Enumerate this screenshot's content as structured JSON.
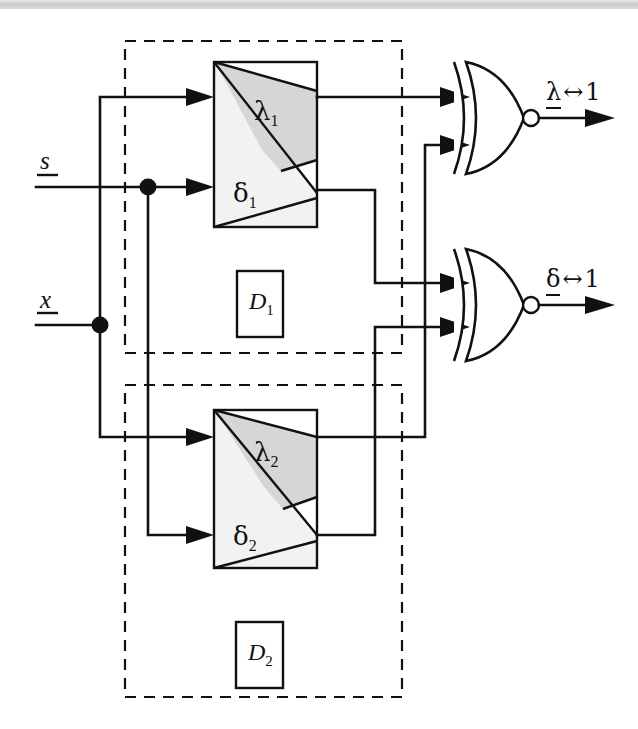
{
  "figure": {
    "type": "logic-block-diagram",
    "title": "",
    "background": "#ffffff",
    "ink_color": "#111111",
    "shade_light": "#f2f2f2",
    "shade_dark": "#d6d6d6",
    "width": 638,
    "height": 729
  },
  "inputs": [
    {
      "id": "s",
      "label": "s",
      "style": "italic-underlined",
      "y": 187
    },
    {
      "id": "x",
      "label": "x",
      "style": "italic-underlined",
      "y": 325
    }
  ],
  "modules": [
    {
      "id": "D1",
      "dashed_label": "D",
      "dashed_sub": "1",
      "dashed_box": {
        "x": 125,
        "y": 41,
        "w": 277,
        "h": 312
      },
      "inner_label_box": {
        "x": 237,
        "y": 271,
        "w": 46,
        "h": 66
      },
      "unit_box": {
        "x": 214,
        "y": 62,
        "w": 103,
        "h": 165
      },
      "upper_fn": {
        "label": "λ",
        "sub": "1"
      },
      "lower_fn": {
        "label": "δ",
        "sub": "1"
      }
    },
    {
      "id": "D2",
      "dashed_label": "D",
      "dashed_sub": "2",
      "dashed_box": {
        "x": 125,
        "y": 385,
        "w": 277,
        "h": 312
      },
      "inner_label_box": {
        "x": 236,
        "y": 622,
        "w": 47,
        "h": 66
      },
      "unit_box": {
        "x": 214,
        "y": 410,
        "w": 103,
        "h": 158
      },
      "upper_fn": {
        "label": "λ",
        "sub": "2"
      },
      "lower_fn": {
        "label": "δ",
        "sub": "2"
      }
    }
  ],
  "gates": [
    {
      "id": "gate-lambda",
      "type": "XNOR",
      "inputs": [
        "λ1",
        "λ2"
      ],
      "output_label_parts": {
        "var": "λ",
        "op": "↔",
        "val": "1"
      },
      "output_label": "λ ↔ 1",
      "cx": 466,
      "cy": 118
    },
    {
      "id": "gate-delta",
      "type": "XNOR",
      "inputs": [
        "δ1",
        "δ2"
      ],
      "output_label_parts": {
        "var": "δ",
        "op": "↔",
        "val": "1"
      },
      "output_label": "δ ↔ 1",
      "cx": 466,
      "cy": 305
    }
  ],
  "junctions": [
    {
      "id": "x-tap",
      "x": 100,
      "y": 325
    },
    {
      "id": "s-tap",
      "x": 148,
      "y": 187
    }
  ],
  "nets": [
    {
      "from": "x",
      "to": "λ1-in",
      "path": "x fans up to λ1 input"
    },
    {
      "from": "x",
      "to": "λ2-in",
      "path": "x fans down to λ2 input"
    },
    {
      "from": "s",
      "to": "δ1-in",
      "path": "s straight to δ1 input"
    },
    {
      "from": "s",
      "to": "δ2-in",
      "path": "s fans down to δ2 input"
    },
    {
      "from": "λ1-out",
      "to": "gate-lambda.in0",
      "path": "straight right"
    },
    {
      "from": "λ2-out",
      "to": "gate-lambda.in1",
      "path": "right, up, right"
    },
    {
      "from": "δ1-out",
      "to": "gate-delta.in0",
      "path": "right, down, right"
    },
    {
      "from": "δ2-out",
      "to": "gate-delta.in1",
      "path": "right, up, right"
    }
  ]
}
